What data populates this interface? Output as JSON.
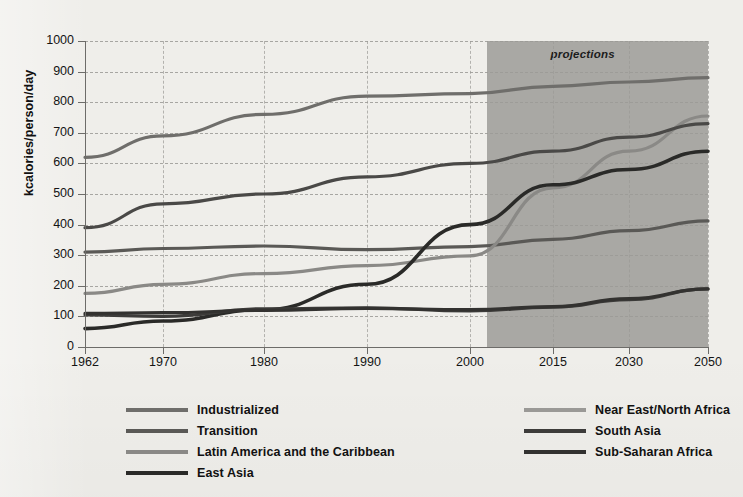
{
  "chart_data": {
    "type": "line",
    "title": "",
    "subtitle": "",
    "xlabel": "",
    "ylabel": "kcalories/person/day",
    "ylim": [
      0,
      1000
    ],
    "ytick_values": [
      0,
      100,
      200,
      300,
      400,
      500,
      600,
      700,
      800,
      900,
      1000
    ],
    "ytick_labels": [
      "0",
      "100",
      "200",
      "300",
      "400",
      "500",
      "600",
      "700",
      "800",
      "900",
      "1000"
    ],
    "x": [
      1962,
      1970,
      1980,
      1990,
      2000,
      2015,
      2030,
      2050
    ],
    "xtick_labels": [
      "1962",
      "1970",
      "1980",
      "1990",
      "2000",
      "2015",
      "2030",
      "2050"
    ],
    "grid": "dashed-both",
    "legend_position": "below-two-columns",
    "annotations": [
      {
        "text": "projections",
        "from_year": 2003,
        "to_year": 2050,
        "style": "shaded-band-italic-bold"
      }
    ],
    "series": [
      {
        "name": "Industrialized",
        "color": "#6f6e6b",
        "width": 3.2,
        "values": [
          620,
          690,
          760,
          820,
          828,
          852,
          866,
          880
        ]
      },
      {
        "name": "Transition",
        "color": "#5a5956",
        "width": 3.2,
        "values": [
          310,
          322,
          330,
          318,
          328,
          352,
          380,
          412
        ]
      },
      {
        "name": "Latin America and the Caribbean",
        "color": "#8a8986",
        "width": 3.2,
        "values": [
          175,
          205,
          240,
          266,
          298,
          520,
          640,
          755
        ]
      },
      {
        "name": "East Asia",
        "color": "#2a2a28",
        "width": 3.6,
        "values": [
          60,
          85,
          122,
          205,
          400,
          530,
          580,
          640
        ]
      },
      {
        "name": "Near East/North Africa",
        "color": "#4a4947",
        "width": 3.2,
        "values": [
          390,
          468,
          500,
          556,
          600,
          640,
          686,
          730
        ]
      },
      {
        "name": "South Asia",
        "color": "#3d3c3a",
        "width": 3.2,
        "values": [
          105,
          100,
          125,
          128,
          118,
          130,
          155,
          190
        ]
      },
      {
        "name": "Sub-Saharan Africa",
        "color": "#333230",
        "width": 3.2,
        "values": [
          110,
          112,
          120,
          126,
          122,
          132,
          158,
          190
        ]
      }
    ]
  },
  "legend": {
    "items": [
      {
        "label": "Industrialized",
        "color": "#6f6e6b"
      },
      {
        "label": "Transition",
        "color": "#5a5956"
      },
      {
        "label": "Latin America and the Caribbean",
        "color": "#8a8986"
      },
      {
        "label": "East Asia",
        "color": "#2a2a28"
      },
      {
        "label": "Near East/North Africa",
        "color": "#9a9996"
      },
      {
        "label": "South Asia",
        "color": "#3d3c3a"
      },
      {
        "label": "Sub-Saharan Africa",
        "color": "#333230"
      }
    ]
  },
  "style": {
    "page_background": "#efeeea",
    "projection_band": "#a9a8a4",
    "axis_color": "#6d6c69",
    "grid_color": "#9b9a96",
    "text_color": "#141414"
  }
}
